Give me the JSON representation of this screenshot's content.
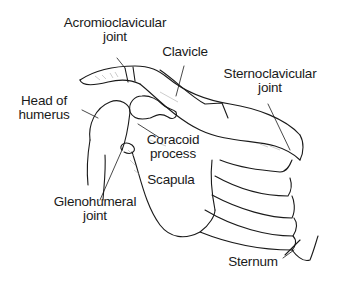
{
  "diagram": {
    "type": "anatomical-illustration",
    "labels": {
      "acromioclavicular": {
        "line1": "Acromioclavicular",
        "line2": "joint"
      },
      "clavicle": {
        "line1": "Clavicle"
      },
      "sternoclavicular": {
        "line1": "Sternoclavicular",
        "line2": "joint"
      },
      "head_of_humerus": {
        "line1": "Head of",
        "line2": "humerus"
      },
      "coracoid": {
        "line1": "Coracoid",
        "line2": "process"
      },
      "scapula": {
        "line1": "Scapula"
      },
      "glenohumeral": {
        "line1": "Glenohumeral",
        "line2": "joint"
      },
      "sternum": {
        "line1": "Sternum"
      }
    },
    "colors": {
      "ink": "#1a1a1a",
      "background": "#ffffff",
      "shade": "#9a9a9a"
    }
  }
}
